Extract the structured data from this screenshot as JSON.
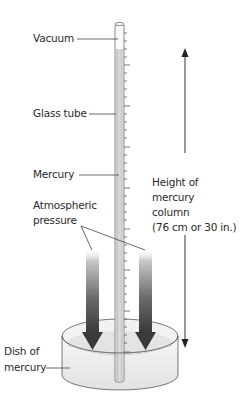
{
  "diagram": {
    "labels": {
      "vacuum": "Vacuum",
      "glass_tube": "Glass tube",
      "mercury": "Mercury",
      "atmospheric_pressure_line1": "Atmospheric",
      "atmospheric_pressure_line2": "pressure",
      "height_line1": "Height of",
      "height_line2": "mercury",
      "height_line3": "column",
      "height_line4": "(76 cm or 30 in.)",
      "dish_line1": "Dish of",
      "dish_line2": "mercury"
    },
    "measurement": {
      "height_cm": 76,
      "height_in": 30
    },
    "colors": {
      "mercury_fill": "#cfcfcf",
      "tube_outline": "#6a6a6a",
      "arrow_dark": "#3a3a3a",
      "dish_fill": "#ececec",
      "leader_line": "#444444"
    }
  }
}
